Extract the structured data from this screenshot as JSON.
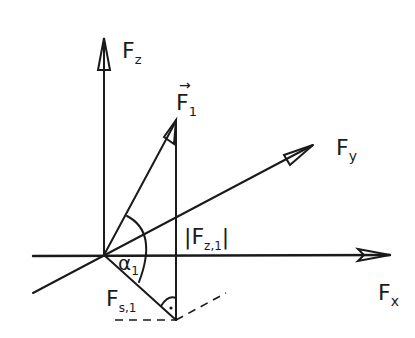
{
  "diagram": {
    "title": "",
    "style": "hand-drawn force decomposition sketch",
    "colors": {
      "ink": "#1a1a1a",
      "background": "#ffffff"
    },
    "labels": {
      "fz": {
        "main": "F",
        "sub": "z"
      },
      "fy": {
        "main": "F",
        "sub": "y"
      },
      "fx": {
        "main": "F",
        "sub": "x"
      },
      "f1": {
        "main": "F",
        "sub": "1",
        "vector_arrow": "→"
      },
      "fz1": {
        "open": "|",
        "main": "F",
        "sub": "z,1",
        "close": "|"
      },
      "fs1": {
        "main": "F",
        "sub": "s,1"
      },
      "alpha1": {
        "main": "α",
        "sub": "1"
      },
      "right_angle_dot": "·"
    },
    "elements": [
      {
        "id": "z-axis",
        "type": "arrow",
        "from": [
          104,
          255
        ],
        "to": [
          104,
          38
        ]
      },
      {
        "id": "x-axis",
        "type": "arrow",
        "from": [
          33,
          255
        ],
        "to": [
          390,
          255
        ]
      },
      {
        "id": "y-axis",
        "type": "arrow",
        "from": [
          33,
          293
        ],
        "to": [
          313,
          145
        ]
      },
      {
        "id": "f1-vector",
        "type": "arrow",
        "from": [
          104,
          255
        ],
        "to": [
          176,
          120
        ]
      },
      {
        "id": "fz1-projection",
        "type": "line",
        "from": [
          176,
          120
        ],
        "to": [
          176,
          320
        ]
      },
      {
        "id": "fs1-line",
        "type": "line",
        "from": [
          104,
          255
        ],
        "to": [
          176,
          320
        ]
      },
      {
        "id": "dashed-x-projection",
        "type": "dashed",
        "from": [
          115,
          320
        ],
        "to": [
          176,
          320
        ]
      },
      {
        "id": "dashed-y-projection",
        "type": "dashed",
        "from": [
          176,
          320
        ],
        "to": [
          225,
          293
        ]
      },
      {
        "id": "alpha1-arc",
        "type": "arc",
        "center": [
          104,
          255
        ]
      }
    ]
  }
}
